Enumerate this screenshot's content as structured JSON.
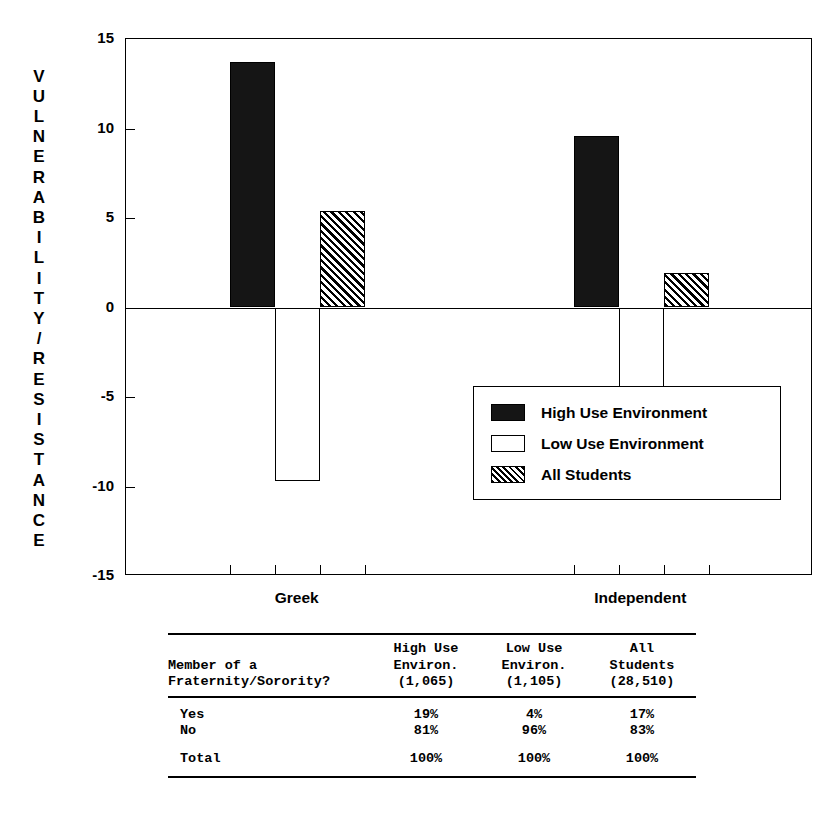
{
  "chart_data": {
    "type": "bar",
    "title": "",
    "xlabel": "",
    "ylabel": "VULNERABILITY/RESISTANCE",
    "ylim": [
      -15,
      15
    ],
    "yticks": [
      15,
      10,
      5,
      0,
      -5,
      -10,
      -15
    ],
    "ytick_labels": [
      "15",
      "10",
      "5",
      "0",
      "-5",
      "-10",
      "-15"
    ],
    "grid": false,
    "legend_position": "inside-lower-right",
    "categories": [
      "Greek",
      "Independent"
    ],
    "series": [
      {
        "name": "High Use Environment",
        "style": "solid-black",
        "values": [
          13.7,
          9.6
        ]
      },
      {
        "name": "Low Use Environment",
        "style": "hollow-white",
        "values": [
          -9.7,
          -4.5
        ]
      },
      {
        "name": "All Students",
        "style": "diagonal-hatch",
        "values": [
          5.4,
          1.9
        ]
      }
    ]
  },
  "axis": {
    "y_title_letters": [
      "V",
      "U",
      "L",
      "N",
      "E",
      "R",
      "A",
      "B",
      "I",
      "L",
      "I",
      "T",
      "Y",
      "/",
      "R",
      "E",
      "S",
      "I",
      "S",
      "T",
      "A",
      "N",
      "C",
      "E"
    ],
    "y_ticks": [
      {
        "label": "15",
        "value": 15
      },
      {
        "label": "10",
        "value": 10
      },
      {
        "label": "5",
        "value": 5
      },
      {
        "label": "0",
        "value": 0
      },
      {
        "label": "-5",
        "value": -5
      },
      {
        "label": "-10",
        "value": -10
      },
      {
        "label": "-15",
        "value": -15
      }
    ],
    "x_categories": [
      {
        "label": "Greek"
      },
      {
        "label": "Independent"
      }
    ]
  },
  "legend": {
    "items": [
      {
        "label": "High Use Environment",
        "style": "solid"
      },
      {
        "label": "Low Use Environment",
        "style": "hollow"
      },
      {
        "label": "All Students",
        "style": "hatch"
      }
    ]
  },
  "table": {
    "row_header": "Member of a\nFraternity/Sorority?",
    "columns": [
      {
        "header": "High Use\nEnviron.\n(1,065)",
        "n": "(1,065)"
      },
      {
        "header": "Low Use\nEnviron.\n(1,105)",
        "n": "(1,105)"
      },
      {
        "header": "All\nStudents\n(28,510)",
        "n": "(28,510)"
      }
    ],
    "rows": [
      {
        "label": "Yes",
        "values": [
          "19%",
          "4%",
          "17%"
        ]
      },
      {
        "label": "No",
        "values": [
          "81%",
          "96%",
          "83%"
        ]
      }
    ],
    "total_row": {
      "label": "Total",
      "values": [
        "100%",
        "100%",
        "100%"
      ]
    }
  },
  "colors": {
    "ink": "#000000",
    "paper": "#ffffff",
    "solid_bar": "#151515"
  }
}
